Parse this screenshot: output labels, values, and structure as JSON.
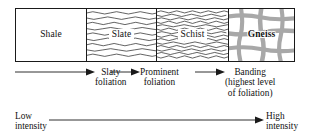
{
  "diagram": {
    "colors": {
      "ink": "#1a1a1a",
      "pattern_gray": "#a8a8a8",
      "background": "#ffffff"
    },
    "rock_sequence": [
      {
        "name": "Shale",
        "pattern": "blank",
        "pattern_name": "no-foliation-pattern"
      },
      {
        "name": "Slate",
        "pattern": "sparse-wavy-lines",
        "pattern_name": "slaty-foliation-pattern"
      },
      {
        "name": "Schist",
        "pattern": "dense-wavy-lines",
        "pattern_name": "schistose-foliation-pattern"
      },
      {
        "name": "Gneiss",
        "pattern": "gray-crosshatch-bands",
        "pattern_name": "gneissic-banding-pattern"
      }
    ],
    "foliation_stages": [
      {
        "lines": [
          "Slaty",
          "foliation"
        ]
      },
      {
        "lines": [
          "Prominent",
          "foliation"
        ]
      },
      {
        "lines": [
          "Banding",
          "(highest level",
          "of foliation)"
        ]
      }
    ],
    "intensity_scale": {
      "low_lines": [
        "Low",
        "intensity"
      ],
      "high_lines": [
        "High",
        "intensity"
      ]
    }
  }
}
